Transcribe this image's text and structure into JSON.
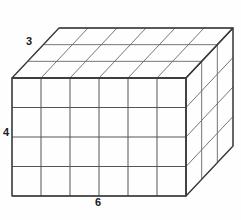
{
  "figure": {
    "shape_type": "rectangular-prism",
    "background_color": "#fefefe",
    "line_color": "#555555",
    "edge_color": "#3a3a3a",
    "label_color": "#1a1a1a"
  },
  "labels": {
    "width": "6",
    "height": "4",
    "depth": "3"
  },
  "dimensions": {
    "width_units": 6,
    "height_units": 4,
    "depth_units": 3,
    "total_cubes": 72
  },
  "geometry": {
    "front_left_x": 12,
    "front_right_x": 186,
    "front_top_y": 78,
    "front_bottom_y": 196,
    "depth_dx": 47,
    "depth_dy": -50,
    "columns": 6,
    "rows": 4,
    "layers": 3
  }
}
